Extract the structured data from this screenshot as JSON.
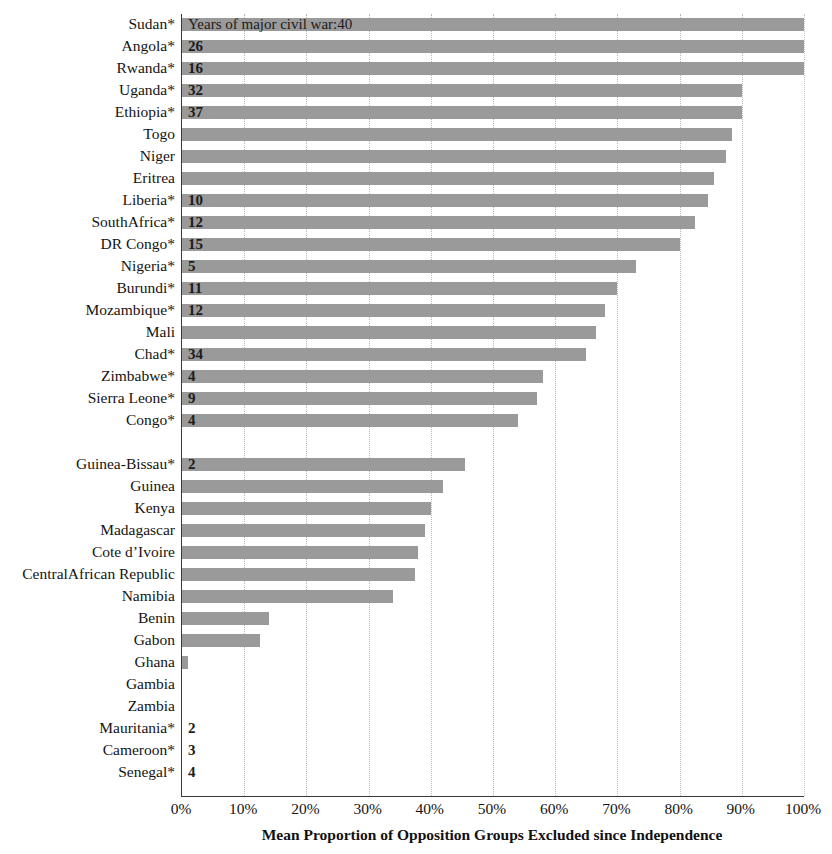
{
  "chart_data": {
    "type": "bar",
    "orientation": "horizontal",
    "title": "",
    "xlabel": "Mean Proportion of Opposition Groups Excluded since Independence",
    "ylabel": "",
    "xlim": [
      0,
      100
    ],
    "xticks": [
      "0%",
      "10%",
      "20%",
      "30%",
      "40%",
      "50%",
      "60%",
      "70%",
      "80%",
      "90%",
      "100%"
    ],
    "xtick_values": [
      0,
      10,
      20,
      30,
      40,
      50,
      60,
      70,
      80,
      90,
      100
    ],
    "grid": "vertical-dotted",
    "legend": "none",
    "bar_color": "#9a9a9a",
    "annotation": "Years of major civil war:40",
    "annotation_row": "Sudan*",
    "note": "Countries marked * experienced major civil war; the number inside the bar is the count of years of major civil war.",
    "categories": [
      "Sudan*",
      "Angola*",
      "Rwanda*",
      "Uganda*",
      "Ethiopia*",
      "Togo",
      "Niger",
      "Eritrea",
      "Liberia*",
      "SouthAfrica*",
      "DR Congo*",
      "Nigeria*",
      "Burundi*",
      "Mozambique*",
      "Mali",
      "Chad*",
      "Zimbabwe*",
      "Sierra Leone*",
      "Congo*",
      "",
      "Guinea-Bissau*",
      "Guinea",
      "Kenya",
      "Madagascar",
      "Cote d’Ivoire",
      "CentralAfrican Republic",
      "Namibia",
      "Benin",
      "Gabon",
      "Ghana",
      "Gambia",
      "Zambia",
      "Mauritania*",
      "Cameroon*",
      "Senegal*"
    ],
    "values": [
      100,
      100,
      100,
      90,
      90,
      88.5,
      87.5,
      85.5,
      84.5,
      82.5,
      80,
      73,
      70,
      68,
      66.5,
      65,
      58,
      57,
      54,
      null,
      45.5,
      42,
      40,
      39,
      38,
      37.5,
      34,
      14,
      12.5,
      1,
      0,
      0,
      0,
      0,
      0
    ],
    "war_years": [
      "40",
      "26",
      "16",
      "32",
      "37",
      "",
      "",
      "",
      "10",
      "12",
      "15",
      "5",
      "11",
      "12",
      "",
      "34",
      "4",
      "9",
      "4",
      "",
      "2",
      "",
      "",
      "",
      "",
      "",
      "",
      "",
      "",
      "",
      "",
      "",
      "2",
      "3",
      "4"
    ],
    "rows": [
      {
        "label": "Sudan*",
        "value": 100,
        "war_years": "40",
        "annotation": "Years of major civil war:40"
      },
      {
        "label": "Angola*",
        "value": 100,
        "war_years": "26"
      },
      {
        "label": "Rwanda*",
        "value": 100,
        "war_years": "16"
      },
      {
        "label": "Uganda*",
        "value": 90,
        "war_years": "32"
      },
      {
        "label": "Ethiopia*",
        "value": 90,
        "war_years": "37"
      },
      {
        "label": "Togo",
        "value": 88.5,
        "war_years": ""
      },
      {
        "label": "Niger",
        "value": 87.5,
        "war_years": ""
      },
      {
        "label": "Eritrea",
        "value": 85.5,
        "war_years": ""
      },
      {
        "label": "Liberia*",
        "value": 84.5,
        "war_years": "10"
      },
      {
        "label": "SouthAfrica*",
        "value": 82.5,
        "war_years": "12"
      },
      {
        "label": "DR Congo*",
        "value": 80,
        "war_years": "15"
      },
      {
        "label": "Nigeria*",
        "value": 73,
        "war_years": "5"
      },
      {
        "label": "Burundi*",
        "value": 70,
        "war_years": "11"
      },
      {
        "label": "Mozambique*",
        "value": 68,
        "war_years": "12"
      },
      {
        "label": "Mali",
        "value": 66.5,
        "war_years": ""
      },
      {
        "label": "Chad*",
        "value": 65,
        "war_years": "34"
      },
      {
        "label": "Zimbabwe*",
        "value": 58,
        "war_years": "4"
      },
      {
        "label": "Sierra Leone*",
        "value": 57,
        "war_years": "9"
      },
      {
        "label": "Congo*",
        "value": 54,
        "war_years": "4"
      },
      {
        "label": "",
        "value": null,
        "war_years": ""
      },
      {
        "label": "Guinea-Bissau*",
        "value": 45.5,
        "war_years": "2"
      },
      {
        "label": "Guinea",
        "value": 42,
        "war_years": ""
      },
      {
        "label": "Kenya",
        "value": 40,
        "war_years": ""
      },
      {
        "label": "Madagascar",
        "value": 39,
        "war_years": ""
      },
      {
        "label": "Cote d’Ivoire",
        "value": 38,
        "war_years": ""
      },
      {
        "label": "CentralAfrican Republic",
        "value": 37.5,
        "war_years": ""
      },
      {
        "label": "Namibia",
        "value": 34,
        "war_years": ""
      },
      {
        "label": "Benin",
        "value": 14,
        "war_years": ""
      },
      {
        "label": "Gabon",
        "value": 12.5,
        "war_years": ""
      },
      {
        "label": "Ghana",
        "value": 1,
        "war_years": ""
      },
      {
        "label": "Gambia",
        "value": 0,
        "war_years": ""
      },
      {
        "label": "Zambia",
        "value": 0,
        "war_years": ""
      },
      {
        "label": "Mauritania*",
        "value": 0,
        "war_years": "2"
      },
      {
        "label": "Cameroon*",
        "value": 0,
        "war_years": "3"
      },
      {
        "label": "Senegal*",
        "value": 0,
        "war_years": "4"
      }
    ]
  }
}
